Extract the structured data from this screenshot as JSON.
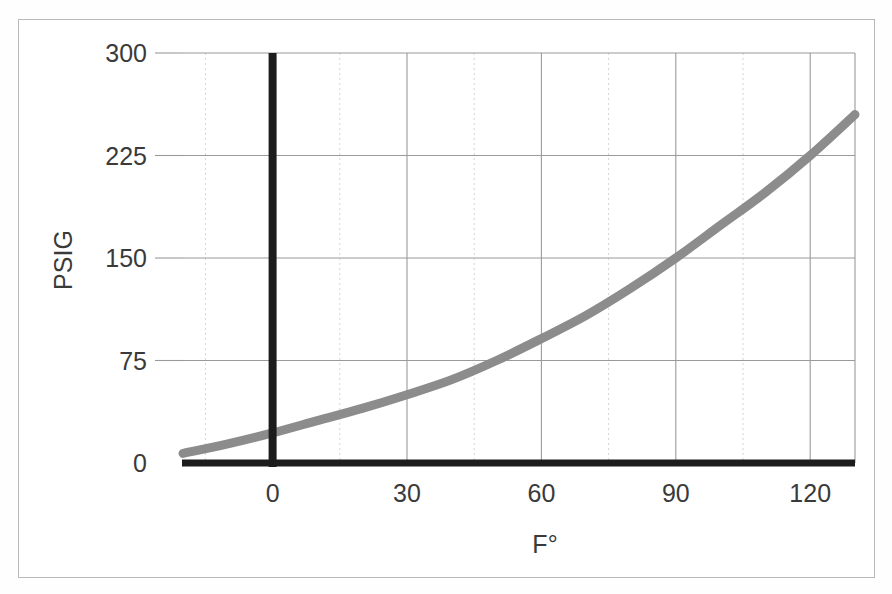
{
  "chart_data": {
    "type": "line",
    "title": "",
    "xlabel": "F°",
    "ylabel": "PSIG",
    "xlim": [
      -20,
      130
    ],
    "ylim": [
      0,
      300
    ],
    "grid": true,
    "legend": null,
    "x_ticks": [
      {
        "value": 0,
        "label": "0"
      },
      {
        "value": 30,
        "label": "30"
      },
      {
        "value": 60,
        "label": "60"
      },
      {
        "value": 90,
        "label": "90"
      },
      {
        "value": 120,
        "label": "120"
      }
    ],
    "y_ticks": [
      {
        "value": 0,
        "label": "0"
      },
      {
        "value": 75,
        "label": "75"
      },
      {
        "value": 150,
        "label": "150"
      },
      {
        "value": 225,
        "label": "225"
      },
      {
        "value": 300,
        "label": "300"
      }
    ],
    "x_minor_ticks": [
      -15,
      15,
      45,
      75,
      105
    ],
    "series": [
      {
        "name": "Saturation pressure curve",
        "color": "#8c8c8c",
        "line_width": 9,
        "x": [
          -20,
          -10,
          0,
          10,
          20,
          30,
          40,
          50,
          60,
          70,
          80,
          90,
          100,
          110,
          120,
          130
        ],
        "y": [
          7,
          14,
          22,
          31,
          40,
          50,
          61,
          75,
          91,
          108,
          128,
          150,
          174,
          198,
          225,
          255
        ]
      }
    ]
  },
  "axes": {
    "y_title": "PSIG",
    "x_title": "F°",
    "axis_color": "#1c1c1c",
    "major_grid_color": "#9a9a9a",
    "minor_grid_color": "#d5d5d5",
    "tick_text_color": "#3a3a3a"
  },
  "page": {
    "border_color": "#b9b9b9",
    "background": "#ffffff"
  }
}
